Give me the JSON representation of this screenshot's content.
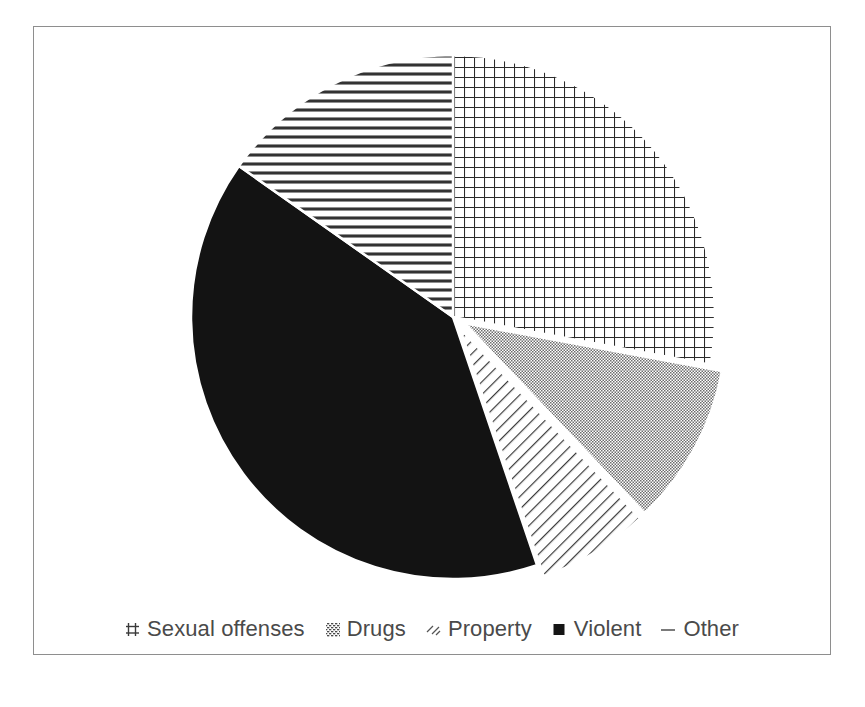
{
  "figure": {
    "background": "#ffffff",
    "frame_color": "#8e8e8e"
  },
  "legend": {
    "position": "bottom",
    "items": [
      {
        "label": "Sexual offenses",
        "marker": "grid-swatch-icon",
        "pattern": "crosshatch-grid",
        "color": "#2b2b2b"
      },
      {
        "label": "Drugs",
        "marker": "dotted-swatch-icon",
        "pattern": "fine-checker",
        "color": "#8a8a8a"
      },
      {
        "label": "Property",
        "marker": "diagonal-hatch-swatch-icon",
        "pattern": "diagonal-lines",
        "color": "#3a3a3a"
      },
      {
        "label": "Violent",
        "marker": "solid-swatch-icon",
        "pattern": "solid",
        "color": "#111111"
      },
      {
        "label": "Other",
        "marker": "horizontal-line-swatch-icon",
        "pattern": "horizontal-lines",
        "color": "#3a3a3a"
      }
    ]
  },
  "chart_data": {
    "type": "pie",
    "title": "",
    "subtitle": "",
    "xlabel": "",
    "ylabel": "",
    "grid": false,
    "legend_position": "bottom",
    "start_angle_deg": 0,
    "direction": "clockwise",
    "center": {
      "x": 452,
      "y": 316
    },
    "radius": 262,
    "labels": [
      "Sexual offenses",
      "Drugs",
      "Property",
      "Violent",
      "Other"
    ],
    "values": [
      27.9,
      10.0,
      6.9,
      40.0,
      15.2
    ],
    "units": "percent",
    "slices": [
      {
        "label": "Sexual offenses",
        "value": 27.9,
        "start_deg": 0.0,
        "end_deg": 100.5,
        "pattern": "crosshatch-grid",
        "exploded": false
      },
      {
        "label": "Drugs",
        "value": 10.0,
        "start_deg": 100.5,
        "end_deg": 136.5,
        "pattern": "fine-checker",
        "exploded": true
      },
      {
        "label": "Property",
        "value": 6.9,
        "start_deg": 136.5,
        "end_deg": 161.3,
        "pattern": "diagonal-lines",
        "exploded": true
      },
      {
        "label": "Violent",
        "value": 40.0,
        "start_deg": 161.3,
        "end_deg": 305.2,
        "pattern": "solid",
        "exploded": false
      },
      {
        "label": "Other",
        "value": 15.2,
        "start_deg": 305.2,
        "end_deg": 360.0,
        "pattern": "horizontal-lines",
        "exploded": false
      }
    ]
  }
}
